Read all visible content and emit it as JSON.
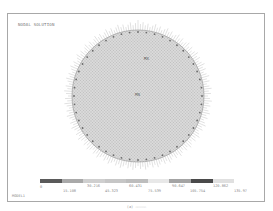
{
  "figure": {
    "title": "NODAL SOLUTION",
    "corner_label": "MODEL1",
    "caption": "(a) —————"
  },
  "legend": {
    "colors": [
      "#5a5a5a",
      "#a9a9a9",
      "#cfcfcf",
      "#c6c6c6",
      "#bdbdbd",
      "#e8e8e8",
      "#a4a4a4",
      "#4a4a4a",
      "#e0e0e0"
    ],
    "labels_top": [
      "0",
      "30.216",
      "60.431",
      "90.647",
      "120.862"
    ],
    "labels_bottom": [
      "15.108",
      "45.323",
      "75.539",
      "105.754",
      "135.97"
    ]
  },
  "plot": {
    "shape": "circular-mesh",
    "mesh_color": "#9a9a9a",
    "boundary_marker_color": "#666666",
    "annotations": [
      "MX",
      "MN"
    ]
  }
}
